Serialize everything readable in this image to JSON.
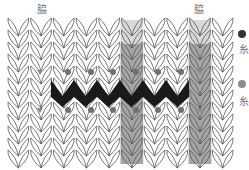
{
  "diagram": {
    "type": "knitting-stitch-chart",
    "header_labels": [
      {
        "text": "脇",
        "x": 40,
        "y": 7
      },
      {
        "text": "脇",
        "x": 193,
        "y": 7
      }
    ],
    "grid": {
      "x0": 7,
      "y0": 20,
      "col_width": 22.7,
      "row_height": 12,
      "cols": 10,
      "rows": 12
    },
    "shaded_columns": [
      {
        "col": 5,
        "top_color": "#d9d9d9",
        "body_color": "#a6a6a6"
      },
      {
        "col": 8,
        "top_color": "#d9d9d9",
        "body_color": "#a6a6a6"
      }
    ],
    "zigzag_band": {
      "color": "#1a1a1a",
      "x_start": 51,
      "x_end": 189,
      "y_top": 80,
      "y_bottom": 107,
      "peaks": 6
    },
    "dots": {
      "accent_color": "#707070",
      "marker_color": "#8a8a8a",
      "upper_row_y": 72,
      "lower_row_y": 110,
      "accent_x": [
        68,
        91,
        113,
        136,
        158,
        181
      ],
      "marker_x": [
        40,
        200
      ]
    },
    "legend": [
      {
        "dot_color": "#333333",
        "text": "糸",
        "dot_y": 30,
        "text_y": 45
      },
      {
        "dot_color": "#8c8c8c",
        "text": "糸",
        "dot_y": 80,
        "text_y": 97
      }
    ],
    "colors": {
      "stitch_line": "#555555",
      "background": "#ffffff"
    }
  }
}
